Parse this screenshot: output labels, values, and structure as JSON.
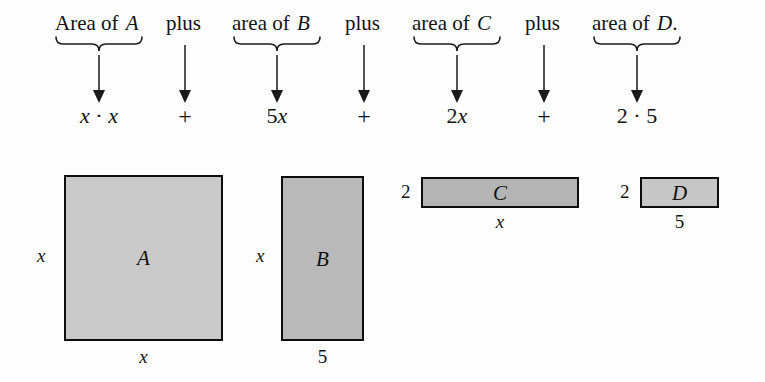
{
  "figure": {
    "type": "algebra-area-model",
    "phrase_row": [
      {
        "id": "phrase-a",
        "text": "Area of ",
        "variable": "A",
        "tail": ""
      },
      {
        "id": "phrase-b",
        "text": "area of ",
        "variable": "B",
        "tail": ""
      },
      {
        "id": "phrase-c",
        "text": "area of ",
        "variable": "C",
        "tail": ""
      },
      {
        "id": "phrase-d",
        "text": "area of ",
        "variable": "D",
        "tail": "."
      }
    ],
    "connectors": [
      {
        "id": "connector-1",
        "label": "plus"
      },
      {
        "id": "connector-2",
        "label": "plus"
      },
      {
        "id": "connector-3",
        "label": "plus"
      }
    ],
    "term_row": [
      {
        "id": "term-a",
        "parts": [
          "x",
          " · ",
          "x"
        ],
        "display": "x · x"
      },
      {
        "id": "term-b",
        "coefficient": "5",
        "variable": "x",
        "display": "5x"
      },
      {
        "id": "term-c",
        "coefficient": "2",
        "variable": "x",
        "display": "2x"
      },
      {
        "id": "term-d",
        "display": "2 · 5"
      }
    ],
    "operators": [
      {
        "id": "operator-1",
        "symbol": "+"
      },
      {
        "id": "operator-2",
        "symbol": "+"
      },
      {
        "id": "operator-3",
        "symbol": "+"
      }
    ],
    "rectangles": [
      {
        "id": "rect-a",
        "label": "A",
        "left_label": "x",
        "bottom_label": "x",
        "fill": "#c9c9c9",
        "stroke": "#0d0d0d",
        "width_units": "x",
        "height_units": "x",
        "area": "x · x"
      },
      {
        "id": "rect-b",
        "label": "B",
        "left_label": "x",
        "bottom_label": "5",
        "fill": "#b9b9b9",
        "stroke": "#0d0d0d",
        "width_units": "5",
        "height_units": "x",
        "area": "5x"
      },
      {
        "id": "rect-c",
        "label": "C",
        "left_label": "2",
        "bottom_label": "x",
        "fill": "#b4b4b4",
        "stroke": "#0d0d0d",
        "width_units": "x",
        "height_units": "2",
        "area": "2x"
      },
      {
        "id": "rect-d",
        "label": "D",
        "left_label": "2",
        "bottom_label": "5",
        "fill": "#c6c6c6",
        "stroke": "#0d0d0d",
        "width_units": "5",
        "height_units": "2",
        "area": "2 · 5"
      }
    ],
    "colors": {
      "background": "#fdfdfd",
      "ink": "#101010",
      "rule": "#1a1a1a"
    }
  }
}
